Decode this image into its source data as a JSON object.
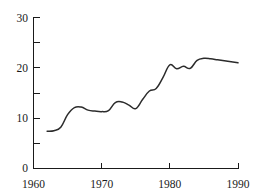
{
  "chart_data": {
    "type": "line",
    "title": "",
    "subtitle": "",
    "xlabel": "",
    "ylabel": "",
    "xlim": [
      1960,
      1990
    ],
    "ylim": [
      0,
      30
    ],
    "grid": false,
    "legend": null,
    "x_ticks_major": [
      1960,
      1970,
      1980,
      1990
    ],
    "x_tick_labels": [
      "1960",
      "1970",
      "1980",
      "1990"
    ],
    "y_ticks_major": [
      0,
      10,
      20,
      30
    ],
    "y_tick_labels": [
      "0",
      "10",
      "20",
      "30"
    ],
    "y_ticks_minor": [
      5,
      15,
      25
    ],
    "line_color": "#2b2b2b",
    "axis_color": "#1a1a1a",
    "series": [
      {
        "name": "series-1",
        "x": [
          1962,
          1963,
          1964,
          1965,
          1966,
          1967,
          1968,
          1969,
          1970,
          1971,
          1972,
          1973,
          1974,
          1975,
          1976,
          1977,
          1978,
          1979,
          1980,
          1981,
          1982,
          1983,
          1984,
          1985,
          1986,
          1987,
          1988,
          1989,
          1990
        ],
        "values": [
          7.3,
          7.4,
          8.1,
          10.6,
          12.0,
          12.1,
          11.5,
          11.3,
          11.2,
          11.4,
          13.0,
          13.1,
          12.5,
          11.8,
          13.6,
          15.3,
          15.8,
          18.0,
          20.5,
          19.7,
          20.2,
          19.8,
          21.4,
          21.8,
          21.7,
          21.5,
          21.3,
          21.1,
          20.9
        ]
      }
    ]
  },
  "axis_labels": {
    "y": [
      "30",
      "20",
      "10",
      "0"
    ],
    "x": [
      "1960",
      "1970",
      "1980",
      "1990"
    ]
  }
}
